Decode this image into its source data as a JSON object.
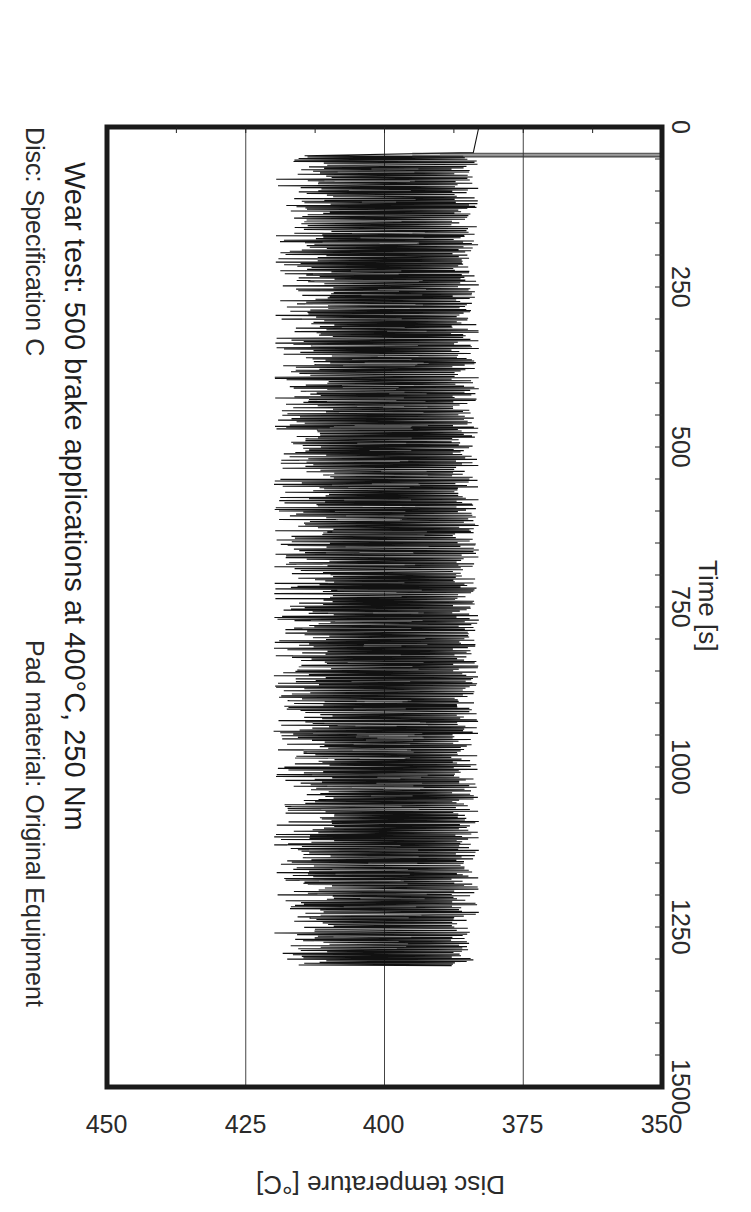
{
  "chart_data": {
    "type": "line",
    "title": "Wear test: 500 brake applications at 400°C, 250 Nm",
    "subtitle_left": "Disc: Specification C",
    "subtitle_right": "Pad material: Original Equipment",
    "xlabel": "Time [s]",
    "ylabel": "Disc temperature [°C]",
    "xlim": [
      0,
      1500
    ],
    "ylim": [
      350,
      450
    ],
    "x_ticks": [
      0,
      250,
      500,
      750,
      1000,
      1250,
      1500
    ],
    "y_ticks": [
      350,
      375,
      400,
      425,
      450
    ],
    "grid": {
      "horizontal": [
        375,
        400,
        425
      ],
      "vertical": false
    },
    "orientation_note": "figure rotated 90 degrees clockwise",
    "series": [
      {
        "name": "Disc temperature",
        "color": "#111111",
        "description": "dense oscillation from brake applications",
        "x_start": 40,
        "x_end": 1310,
        "warmup": [
          [
            0,
            383
          ],
          [
            40,
            384
          ],
          [
            50,
            384
          ]
        ],
        "band_min": 383,
        "band_max": 420,
        "typical_peak": 416,
        "typical_trough": 386,
        "envelope_points": [
          {
            "x": 50,
            "min": 383,
            "max": 411
          },
          {
            "x": 100,
            "min": 384,
            "max": 416
          },
          {
            "x": 250,
            "min": 384,
            "max": 418
          },
          {
            "x": 500,
            "min": 384,
            "max": 419
          },
          {
            "x": 750,
            "min": 384,
            "max": 418
          },
          {
            "x": 1000,
            "min": 384,
            "max": 419
          },
          {
            "x": 1250,
            "min": 384,
            "max": 418
          },
          {
            "x": 1310,
            "min": 384,
            "max": 418
          }
        ]
      }
    ]
  },
  "labels": {
    "subtitle_left": "Disc: Specification C",
    "subtitle_right": "Pad material: Original Equipment",
    "title": "Wear test: 500 brake applications at 400°C, 250 Nm",
    "xlabel": "Time [s]",
    "ylabel": "Disc temperature [°C]",
    "x_ticks": [
      "0",
      "250",
      "500",
      "750",
      "1000",
      "1250",
      "1500"
    ],
    "y_ticks": [
      "350",
      "375",
      "400",
      "425",
      "450"
    ]
  }
}
